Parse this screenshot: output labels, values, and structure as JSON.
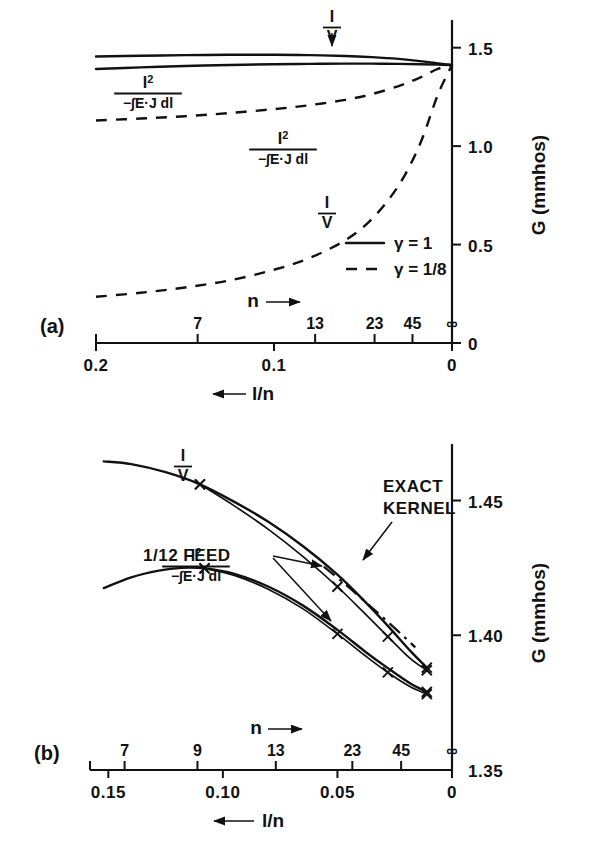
{
  "figure": {
    "panels": [
      {
        "id": "a",
        "panel_label": "(a)",
        "y_axis_title": "G (mmhos)",
        "x_axis_title_bottom": "l/n",
        "x_axis_title_top": "n",
        "x_arrow_bottom": "←",
        "x_arrow_top": "→",
        "y_ticks": [
          "0",
          "0.5",
          "1.0",
          "1.5"
        ],
        "y_tick_values": [
          0,
          0.5,
          1.0,
          1.5
        ],
        "x_ticks_bottom": [
          "0.2",
          "0.1",
          "0"
        ],
        "x_tick_bottom_values": [
          0.2,
          0.1,
          0
        ],
        "x_ticks_top": [
          "7",
          "13",
          "23",
          "45",
          "∞"
        ],
        "x_tick_top_values": [
          0.1429,
          0.0769,
          0.0435,
          0.0222,
          0
        ],
        "legend": [
          {
            "style": "solid",
            "label": "γ = 1"
          },
          {
            "style": "dashed",
            "label": "γ = 1/8"
          }
        ],
        "curve_labels": [
          {
            "name": "I-over-V-solid",
            "numerator": "I",
            "denominator": "V",
            "superscript": ""
          },
          {
            "name": "I2-over-EJ-solid",
            "numerator": "I",
            "superscript": "2",
            "denominator": "−∫E·J dl"
          },
          {
            "name": "I2-over-EJ-dashed",
            "numerator": "I",
            "superscript": "2",
            "denominator": "−∫E·J dl"
          },
          {
            "name": "I-over-V-dashed",
            "numerator": "I",
            "denominator": "V",
            "superscript": ""
          }
        ]
      },
      {
        "id": "b",
        "panel_label": "(b)",
        "y_axis_title": "G (mmhos)",
        "x_axis_title_bottom": "l/n",
        "x_axis_title_top": "n",
        "x_arrow_bottom": "←",
        "x_arrow_top": "→",
        "y_ticks": [
          "1.35",
          "1.40",
          "1.45"
        ],
        "y_tick_values": [
          1.35,
          1.4,
          1.45
        ],
        "x_ticks_bottom": [
          "0.15",
          "0.10",
          "0.05",
          "0"
        ],
        "x_tick_bottom_values": [
          0.15,
          0.1,
          0.05,
          0
        ],
        "x_ticks_top": [
          "7",
          "9",
          "13",
          "23",
          "45",
          "∞"
        ],
        "x_tick_top_values": [
          0.1429,
          0.1111,
          0.0769,
          0.0435,
          0.0222,
          0
        ],
        "annotations": [
          {
            "name": "exact-kernel",
            "line1": "EXACT",
            "line2": "KERNEL"
          },
          {
            "name": "feed-label",
            "text": "1/12  FEED"
          }
        ],
        "curve_labels": [
          {
            "name": "I-over-V-solid",
            "numerator": "I",
            "denominator": "V",
            "superscript": ""
          },
          {
            "name": "I2-over-EJ-solid",
            "numerator": "I",
            "superscript": "2",
            "denominator": "−∫E·J dl"
          }
        ]
      }
    ]
  },
  "chart_data": [
    {
      "type": "line",
      "title": "(a)",
      "xlabel": "l/n",
      "ylabel": "G (mmhos)",
      "xlim": [
        0.2,
        0.0
      ],
      "ylim": [
        0,
        1.6
      ],
      "x_reversed": true,
      "grid": false,
      "legend_position": "lower-right",
      "series": [
        {
          "name": "I/V, gamma = 1",
          "style": "solid",
          "x": [
            0.2,
            0.175,
            0.15,
            0.125,
            0.1,
            0.08,
            0.06,
            0.045,
            0.03,
            0.018,
            0.008,
            0.0
          ],
          "y": [
            1.455,
            1.459,
            1.462,
            1.464,
            1.464,
            1.462,
            1.458,
            1.452,
            1.443,
            1.432,
            1.42,
            1.412
          ]
        },
        {
          "name": "I2/-int E.J dl, gamma = 1",
          "style": "solid",
          "x": [
            0.2,
            0.175,
            0.15,
            0.125,
            0.1,
            0.08,
            0.06,
            0.045,
            0.03,
            0.018,
            0.008,
            0.0
          ],
          "y": [
            1.392,
            1.4,
            1.407,
            1.412,
            1.416,
            1.418,
            1.419,
            1.419,
            1.418,
            1.416,
            1.414,
            1.412
          ]
        },
        {
          "name": "I2/-int E.J dl, gamma = 1/8",
          "style": "dashed",
          "x": [
            0.2,
            0.175,
            0.15,
            0.125,
            0.1,
            0.08,
            0.06,
            0.045,
            0.03,
            0.018,
            0.008,
            0.0
          ],
          "y": [
            1.13,
            1.14,
            1.152,
            1.168,
            1.188,
            1.208,
            1.235,
            1.264,
            1.305,
            1.348,
            1.392,
            1.412
          ]
        },
        {
          "name": "I/V, gamma = 1/8",
          "style": "dashed",
          "x": [
            0.2,
            0.175,
            0.15,
            0.125,
            0.1,
            0.08,
            0.06,
            0.045,
            0.03,
            0.018,
            0.008,
            0.0
          ],
          "y": [
            0.235,
            0.255,
            0.282,
            0.318,
            0.372,
            0.432,
            0.522,
            0.63,
            0.8,
            1.01,
            1.26,
            1.412
          ]
        }
      ]
    },
    {
      "type": "line",
      "title": "(b)",
      "xlabel": "l/n",
      "ylabel": "G (mmhos)",
      "xlim": [
        0.158,
        0.0
      ],
      "ylim": [
        1.35,
        1.468
      ],
      "x_reversed": true,
      "grid": false,
      "series": [
        {
          "name": "I/V exact, 1/12 feed",
          "style": "solid",
          "markers": false,
          "x": [
            0.152,
            0.14,
            0.125,
            0.11,
            0.095,
            0.08,
            0.065,
            0.05,
            0.038,
            0.028,
            0.018,
            0.011
          ],
          "y": [
            1.4645,
            1.4635,
            1.4605,
            1.456,
            1.4495,
            1.442,
            1.433,
            1.4225,
            1.4125,
            1.4035,
            1.394,
            1.388
          ]
        },
        {
          "name": "I/V marker branch",
          "style": "solid-thin",
          "markers": true,
          "x": [
            0.11,
            0.095,
            0.08,
            0.065,
            0.05,
            0.038,
            0.028,
            0.018,
            0.011
          ],
          "y": [
            1.456,
            1.448,
            1.4392,
            1.4292,
            1.418,
            1.408,
            1.3995,
            1.3912,
            1.387
          ],
          "marker_x": [
            0.11,
            0.05,
            0.028,
            0.011
          ],
          "marker_y": [
            1.456,
            1.418,
            1.3995,
            1.387
          ]
        },
        {
          "name": "EXACT KERNEL",
          "style": "dash-dot",
          "markers": false,
          "x": [
            0.056,
            0.046,
            0.036,
            0.028,
            0.021,
            0.016
          ],
          "y": [
            1.4255,
            1.4185,
            1.411,
            1.405,
            1.3995,
            1.3955
          ]
        },
        {
          "name": "I2/-int E.J dl exact, 1/12 feed",
          "style": "solid",
          "markers": false,
          "x": [
            0.152,
            0.14,
            0.128,
            0.118,
            0.108,
            0.095,
            0.08,
            0.065,
            0.05,
            0.038,
            0.028,
            0.018,
            0.011
          ],
          "y": [
            1.4175,
            1.4215,
            1.424,
            1.425,
            1.4248,
            1.4228,
            1.418,
            1.411,
            1.402,
            1.394,
            1.3878,
            1.382,
            1.379
          ]
        },
        {
          "name": "I2 marker branch",
          "style": "solid-thin",
          "markers": true,
          "x": [
            0.108,
            0.095,
            0.08,
            0.065,
            0.05,
            0.038,
            0.028,
            0.018,
            0.011
          ],
          "y": [
            1.4248,
            1.4222,
            1.417,
            1.4098,
            1.4005,
            1.3925,
            1.3862,
            1.3808,
            1.3782
          ],
          "marker_x": [
            0.108,
            0.05,
            0.028,
            0.011
          ],
          "marker_y": [
            1.4248,
            1.4005,
            1.3862,
            1.3782
          ]
        }
      ]
    }
  ]
}
